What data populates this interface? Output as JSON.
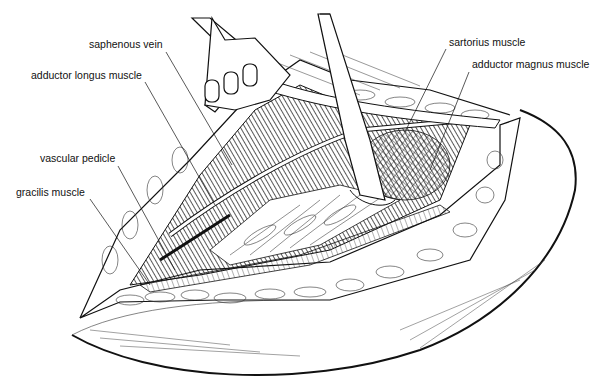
{
  "figure": {
    "type": "anatomical line illustration",
    "labels": [
      {
        "id": "saphenous-vein",
        "text": "saphenous vein",
        "x": 89,
        "y": 44,
        "anchor": [
          166,
          48
        ],
        "target": [
          232,
          165
        ]
      },
      {
        "id": "adductor-longus",
        "text": "adductor longus muscle",
        "x": 31,
        "y": 74,
        "anchor": [
          145,
          80
        ],
        "target": [
          215,
          205
        ]
      },
      {
        "id": "vascular-pedicle",
        "text": "vascular pedicle",
        "x": 40,
        "y": 157,
        "anchor": [
          118,
          164
        ],
        "target": [
          175,
          270
        ]
      },
      {
        "id": "gracilis",
        "text": "gracilis muscle",
        "x": 16,
        "y": 191,
        "anchor": [
          90,
          197
        ],
        "target": [
          150,
          285
        ]
      },
      {
        "id": "sartorius",
        "text": "sartorius muscle",
        "x": 449,
        "y": 41,
        "anchor": [
          446,
          47
        ],
        "target": [
          405,
          132
        ]
      },
      {
        "id": "adductor-magnus",
        "text": "adductor magnus muscle",
        "x": 472,
        "y": 63,
        "anchor": [
          469,
          70
        ],
        "target": [
          430,
          170
        ]
      }
    ]
  }
}
